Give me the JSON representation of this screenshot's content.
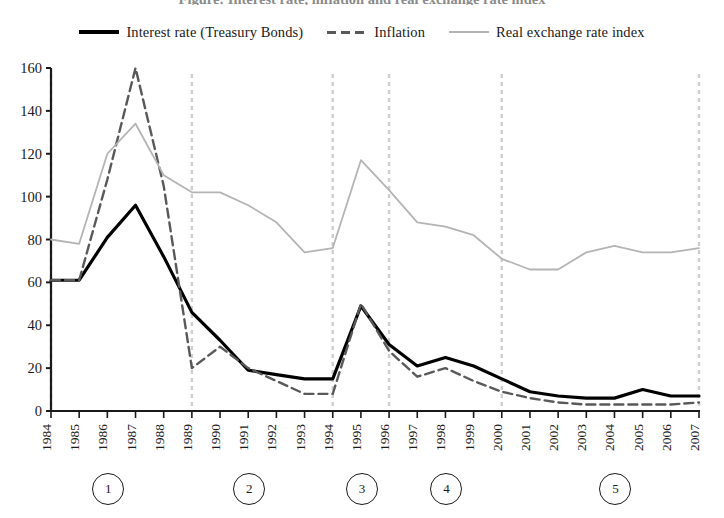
{
  "title": "Figure: Interest rate, inflation and real exchange rate index",
  "legend": {
    "position": "top-center",
    "items": [
      {
        "label": "Interest rate (Treasury Bonds)",
        "style": "solid-thick",
        "color": "#000000",
        "icon": "legend-line-solid-thick"
      },
      {
        "label": "Inflation",
        "style": "dashed",
        "color": "#595959",
        "icon": "legend-line-dashed"
      },
      {
        "label": "Real exchange rate index",
        "style": "thin-solid",
        "color": "#b4b4b4",
        "icon": "legend-line-thin"
      }
    ]
  },
  "axes": {
    "y_ticks": [
      "0",
      "20",
      "40",
      "60",
      "80",
      "100",
      "120",
      "140",
      "160"
    ],
    "x_ticks": [
      "1984",
      "1985",
      "1986",
      "1987",
      "1988",
      "1989",
      "1990",
      "1991",
      "1992",
      "1993",
      "1994",
      "1995",
      "1996",
      "1997",
      "1998",
      "1999",
      "2000",
      "2001",
      "2002",
      "2003",
      "2004",
      "2005",
      "2006",
      "2007"
    ]
  },
  "markers": [
    {
      "label": "1",
      "year": "1986"
    },
    {
      "label": "2",
      "year": "1991"
    },
    {
      "label": "3",
      "year": "1995"
    },
    {
      "label": "4",
      "year": "1998"
    },
    {
      "label": "5",
      "year": "2004"
    }
  ],
  "chart_data": {
    "type": "line",
    "title": "Figure: Interest rate, inflation and real exchange rate index",
    "xlabel": "",
    "ylabel": "",
    "ylim": [
      0,
      160
    ],
    "ytick_step": 20,
    "grid": "vertical dashed gridlines only",
    "legend_position": "top-center",
    "x": [
      "1984",
      "1985",
      "1986",
      "1987",
      "1988",
      "1989",
      "1990",
      "1991",
      "1992",
      "1993",
      "1994",
      "1995",
      "1996",
      "1997",
      "1998",
      "1999",
      "2000",
      "2001",
      "2002",
      "2003",
      "2004",
      "2005",
      "2006",
      "2007"
    ],
    "vertical_gridlines": [
      "1984",
      "1989",
      "1994",
      "1996",
      "2000",
      "2007"
    ],
    "series": [
      {
        "name": "Interest rate (Treasury Bonds)",
        "color": "#000000",
        "style": "solid",
        "width": 3.2,
        "values": [
          61,
          61,
          81,
          96,
          72,
          46,
          33,
          19,
          17,
          15,
          15,
          49,
          31,
          21,
          25,
          21,
          15,
          9,
          7,
          6,
          6,
          10,
          7,
          7
        ]
      },
      {
        "name": "Inflation",
        "color": "#595959",
        "style": "dashed",
        "width": 2.4,
        "values": [
          61,
          61,
          108,
          160,
          105,
          20,
          30,
          20,
          14,
          8,
          8,
          50,
          28,
          16,
          20,
          14,
          9,
          6,
          4,
          3,
          3,
          3,
          3,
          4
        ]
      },
      {
        "name": "Real exchange rate index",
        "color": "#b4b4b4",
        "style": "solid",
        "width": 1.8,
        "values": [
          80,
          78,
          120,
          134,
          110,
          102,
          102,
          96,
          88,
          74,
          76,
          117,
          103,
          88,
          86,
          82,
          71,
          66,
          66,
          74,
          77,
          74,
          74,
          76
        ]
      }
    ]
  }
}
